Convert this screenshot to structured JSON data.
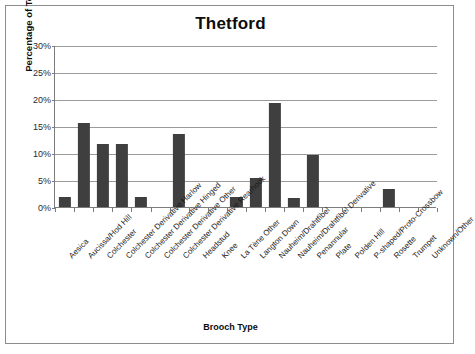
{
  "chart_data": {
    "type": "bar",
    "title": "Thetford",
    "xlabel": "Brooch Type",
    "ylabel": "Percentage of Total",
    "ylim": [
      0,
      30
    ],
    "ytick_labels": [
      "0%",
      "5%",
      "10%",
      "15%",
      "20%",
      "25%",
      "30%"
    ],
    "ytick_values": [
      0,
      5,
      10,
      15,
      20,
      25,
      30
    ],
    "grid": true,
    "legend": null,
    "bar_color": "#3f3f3f",
    "categories": [
      "Aesica",
      "Aucissa/Hod Hill",
      "Colchester",
      "Colchester Derivative Harlow",
      "Colchester Derivative Hinged",
      "Colchester Derivative Other",
      "Colchester Derivative Rearhook",
      "Headstud",
      "Knee",
      "La Tène Other",
      "Langton Down",
      "Nauheim/Drahtfibel",
      "Nauheim/Drahtfibel Derivative",
      "Penannular",
      "Plate",
      "Polden Hill",
      "P-shaped/Proto-Crossbow",
      "Rosette",
      "Trumpet",
      "Unknown/Other"
    ],
    "values": [
      1.9,
      15.6,
      11.6,
      11.6,
      1.9,
      0,
      13.5,
      0,
      0,
      1.8,
      5.4,
      19.3,
      1.7,
      9.6,
      0,
      0,
      0,
      3.3,
      0,
      0
    ]
  }
}
